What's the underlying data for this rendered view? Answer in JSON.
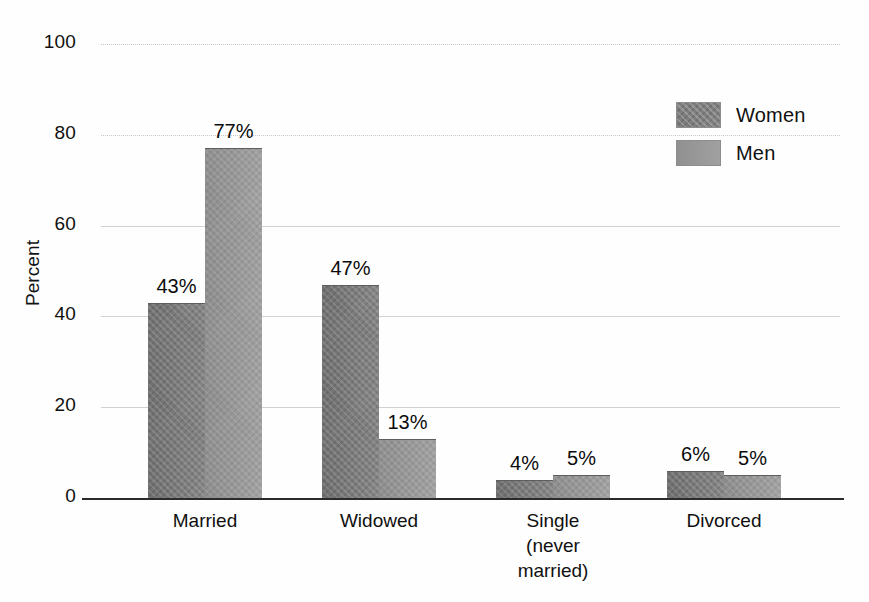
{
  "chart_data": {
    "type": "bar",
    "title": "",
    "subtitle": "",
    "xlabel": "",
    "ylabel": "Percent",
    "ylim": [
      0,
      100
    ],
    "yticks": [
      0,
      20,
      40,
      60,
      80,
      100
    ],
    "ytick_labels": [
      "0",
      "20",
      "40",
      "60",
      "80",
      "100"
    ],
    "grid": true,
    "grid_axis": "y",
    "legend_position": "top-right",
    "categories": [
      "Married",
      "Widowed",
      "Single (never married)",
      "Divorced"
    ],
    "category_labels": [
      "Married",
      "Widowed",
      "Single\n(never\nmarried)",
      "Divorced"
    ],
    "series": [
      {
        "name": "Women",
        "color": "#7e7e7e",
        "pattern": "crosshatch",
        "values": [
          43,
          47,
          4,
          6
        ],
        "data_labels": [
          "43%",
          "47%",
          "4%",
          "6%"
        ]
      },
      {
        "name": "Men",
        "color": "#9b9b9b",
        "pattern": "solid",
        "values": [
          77,
          13,
          5,
          5
        ],
        "data_labels": [
          "77%",
          "13%",
          "5%",
          "5%"
        ]
      }
    ]
  },
  "legend": {
    "items": [
      {
        "label": "Women"
      },
      {
        "label": "Men"
      }
    ]
  },
  "axes": {
    "y_label": "Percent",
    "y_ticks": [
      "100",
      "80",
      "60",
      "40",
      "20",
      "0"
    ]
  },
  "colors": {
    "women_bar": "#7e7e7e",
    "men_bar": "#9b9b9b",
    "gridline": "#c9c9c9",
    "axis": "#2b2b2b",
    "text": "#101010",
    "background": "#ffffff"
  }
}
